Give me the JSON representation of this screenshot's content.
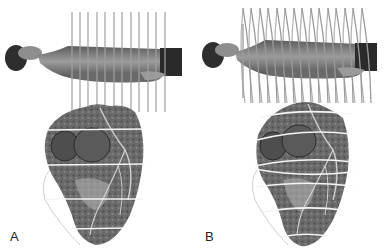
{
  "figure": {
    "panels": [
      {
        "id": "A",
        "label": "A",
        "scan_type": "parallel-lines",
        "description": "Supine patient with parallel axial scan planes; heart below with evenly spaced horizontal slice lines"
      },
      {
        "id": "B",
        "label": "B",
        "scan_type": "helical",
        "description": "Supine patient with helical (spiral) scan path; heart below with spiral slice lines"
      }
    ],
    "colors": {
      "background": "#ffffff",
      "scan_line": "#9a9a9a",
      "body": "#7a7a7a",
      "heart": "#5a5a5a",
      "slice_line": "#f2f2f2"
    }
  }
}
